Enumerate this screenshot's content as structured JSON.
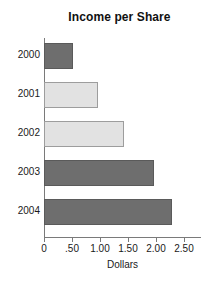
{
  "chart_data": {
    "type": "bar",
    "orientation": "horizontal",
    "title": "Income per Share",
    "xlabel": "Dollars",
    "ylabel": "",
    "categories": [
      "2000",
      "2001",
      "2002",
      "2003",
      "2004"
    ],
    "values": [
      0.52,
      0.96,
      1.42,
      1.97,
      2.29
    ],
    "xlim": [
      0,
      2.5
    ],
    "xticks": [
      0,
      0.5,
      1.0,
      1.5,
      2.0,
      2.5
    ],
    "xtick_labels": [
      "0",
      ".50",
      "1.00",
      "1.50",
      "2.00",
      "2.50"
    ],
    "grid": false,
    "legend": null,
    "bar_colors": [
      "#6e6e6e",
      "#e2e2e2",
      "#e2e2e2",
      "#6e6e6e",
      "#6e6e6e"
    ],
    "bar_shades": [
      "dark",
      "light",
      "light",
      "dark",
      "dark"
    ],
    "colors": {
      "dark_fill": "#6e6e6e",
      "light_fill": "#e2e2e2",
      "bar_outline": "#8a8a8a",
      "axis": "#7a7a7a",
      "text": "#1a1a1a",
      "background": "#ffffff"
    }
  }
}
